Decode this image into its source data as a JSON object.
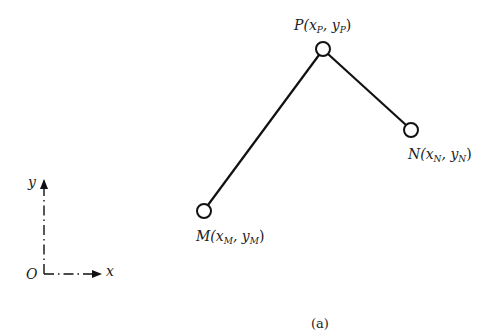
{
  "diagram": {
    "nodes": [
      {
        "id": "P",
        "label_main": "P(x",
        "sub1": "P",
        "mid": ", y",
        "sub2": "P",
        "end": ")",
        "cx": 323,
        "cy": 49
      },
      {
        "id": "N",
        "label_main": "N(x",
        "sub1": "N",
        "mid": ", y",
        "sub2": "N",
        "end": ")",
        "cx": 411,
        "cy": 130
      },
      {
        "id": "M",
        "label_main": "M(x",
        "sub1": "M",
        "mid": ", y",
        "sub2": "M",
        "end": ")",
        "cx": 204,
        "cy": 211
      }
    ],
    "edges": [
      {
        "from": "M",
        "to": "P"
      },
      {
        "from": "P",
        "to": "N"
      }
    ],
    "axes": {
      "origin_label": "O",
      "x_label": "x",
      "y_label": "y"
    },
    "caption": "(a)"
  }
}
